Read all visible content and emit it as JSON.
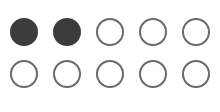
{
  "indicator": {
    "total": 10,
    "filled_count": 2,
    "columns": 5,
    "rows": 2,
    "colors": {
      "filled": "#3c3c3c",
      "empty_border": "#6a6a6a",
      "empty_fill": "#ffffff"
    },
    "dots": [
      {
        "state": "filled"
      },
      {
        "state": "filled"
      },
      {
        "state": "empty"
      },
      {
        "state": "empty"
      },
      {
        "state": "empty"
      },
      {
        "state": "empty"
      },
      {
        "state": "empty"
      },
      {
        "state": "empty"
      },
      {
        "state": "empty"
      },
      {
        "state": "empty"
      }
    ]
  }
}
